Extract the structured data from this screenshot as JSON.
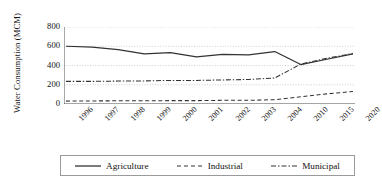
{
  "chart_data": {
    "type": "line",
    "title": "",
    "xlabel": "",
    "ylabel": "Water Consumption (MCM)",
    "categories": [
      "1996",
      "1997",
      "1998",
      "1999",
      "2000",
      "2001",
      "2002",
      "2003",
      "2004",
      "2010",
      "2015",
      "2020"
    ],
    "yticks": [
      "800",
      "600",
      "400",
      "200",
      "0"
    ],
    "ylim": [
      0,
      800
    ],
    "grid": true,
    "legend_position": "bottom",
    "series": [
      {
        "name": "Agriculture",
        "style": "solid",
        "color": "#333333",
        "values": [
          600,
          590,
          565,
          520,
          535,
          490,
          515,
          510,
          545,
          410,
          465,
          520
        ]
      },
      {
        "name": "Industrial",
        "style": "dashed",
        "color": "#333333",
        "values": [
          30,
          32,
          33,
          33,
          35,
          35,
          38,
          38,
          45,
          75,
          105,
          130
        ]
      },
      {
        "name": "Municipal",
        "style": "dashdot",
        "color": "#333333",
        "values": [
          235,
          235,
          238,
          240,
          245,
          245,
          250,
          255,
          270,
          415,
          475,
          525
        ]
      }
    ]
  },
  "legend": {
    "items": [
      {
        "label": "Agriculture"
      },
      {
        "label": "Industrial"
      },
      {
        "label": "Municipal"
      }
    ]
  }
}
